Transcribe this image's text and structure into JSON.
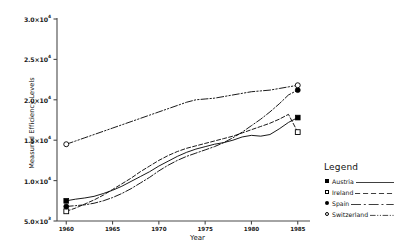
{
  "chart_data": {
    "type": "line",
    "title": "",
    "xlabel": "Year",
    "ylabel": "Measured Efficiency Levels",
    "xlim": [
      1959,
      1986
    ],
    "ylim": [
      5000,
      30000
    ],
    "grid": false,
    "legend_position": "right",
    "legend_title": "Legend",
    "x_ticks": [
      1960,
      1965,
      1970,
      1975,
      1980,
      1985
    ],
    "x_tick_labels": [
      "1960",
      "1965",
      "1970",
      "1975",
      "1980",
      "1985"
    ],
    "y_ticks": [
      5000,
      10000,
      15000,
      20000,
      25000,
      30000
    ],
    "y_tick_labels": [
      {
        "mantissa": "5.0×10",
        "exp": "3"
      },
      {
        "mantissa": "1.0×10",
        "exp": "4"
      },
      {
        "mantissa": "1.5×10",
        "exp": "4"
      },
      {
        "mantissa": "2.0×10",
        "exp": "4"
      },
      {
        "mantissa": "2.5×10",
        "exp": "4"
      },
      {
        "mantissa": "3.0×10",
        "exp": "4"
      }
    ],
    "x": [
      1960,
      1961,
      1962,
      1963,
      1964,
      1965,
      1966,
      1967,
      1968,
      1969,
      1970,
      1971,
      1972,
      1973,
      1974,
      1975,
      1976,
      1977,
      1978,
      1979,
      1980,
      1981,
      1982,
      1983,
      1984,
      1985
    ],
    "series": [
      {
        "name": "Austria",
        "marker": "filled-square",
        "linestyle": "solid",
        "color": "#000000",
        "values": [
          7500,
          7700,
          7850,
          8050,
          8400,
          8800,
          9300,
          9900,
          10500,
          11100,
          11800,
          12400,
          13000,
          13500,
          13900,
          14200,
          14500,
          14700,
          15000,
          15400,
          15600,
          15500,
          15700,
          16400,
          17200,
          17800
        ]
      },
      {
        "name": "Ireland",
        "marker": "open-square",
        "linestyle": "dashed",
        "color": "#000000",
        "values": [
          6200,
          6600,
          7100,
          7600,
          8200,
          8900,
          9600,
          10300,
          11100,
          11800,
          12500,
          13100,
          13600,
          14000,
          14300,
          14600,
          14900,
          15200,
          15500,
          15900,
          16300,
          16700,
          17100,
          17600,
          18200,
          16000
        ]
      },
      {
        "name": "Spain",
        "marker": "filled-circle",
        "linestyle": "dashdot",
        "color": "#000000",
        "values": [
          6800,
          6900,
          7000,
          7200,
          7500,
          7900,
          8400,
          9000,
          9700,
          10400,
          11200,
          11900,
          12500,
          13000,
          13400,
          13800,
          14200,
          14700,
          15300,
          16000,
          16800,
          17600,
          18500,
          19500,
          20600,
          21200
        ]
      },
      {
        "name": "Switzerland",
        "marker": "open-circle",
        "linestyle": "dashdotdot",
        "color": "#000000",
        "values": [
          14500,
          14900,
          15300,
          15700,
          16100,
          16500,
          16900,
          17300,
          17700,
          18100,
          18500,
          18900,
          19300,
          19700,
          20000,
          20100,
          20200,
          20400,
          20600,
          20800,
          21000,
          21100,
          21200,
          21400,
          21600,
          21800
        ]
      }
    ]
  },
  "legend": {
    "title": "Legend",
    "items": [
      {
        "label": "Austria",
        "marker": "filled-square"
      },
      {
        "label": "Ireland",
        "marker": "open-square"
      },
      {
        "label": "Spain",
        "marker": "filled-circle"
      },
      {
        "label": "Switzerland",
        "marker": "open-circle"
      }
    ]
  }
}
